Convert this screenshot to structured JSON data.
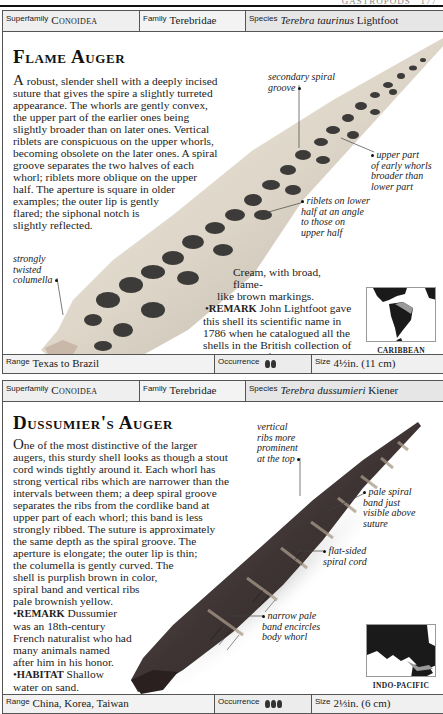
{
  "page": {
    "running_header": "GASTROPODS",
    "page_number": "177"
  },
  "entries": [
    {
      "taxonomy": {
        "superfamily_label": "Superfamily",
        "superfamily": "Conoidea",
        "family_label": "Family",
        "family": "Terebridae",
        "species_label": "Species",
        "species_italic": "Terebra taurinus",
        "species_author": "Lightfoot"
      },
      "title": "Flame Auger",
      "description": "A robust, slender shell with a deeply incised suture that gives the spire a slightly turreted appearance. The whorls are gently convex, the upper part of the earlier ones being slightly broader than on later ones. Vertical riblets are conspicuous on the upper whorls, becoming obsolete on the later ones. A spiral groove separates the two halves of each whorl; riblets more oblique on the upper half. The aperture is square in older examples; the outer lip is gently flared; the siphonal notch is slightly reflected.",
      "description_lines": [
        "robust, slender shell with a deeply incised",
        "suture that gives the spire a slightly turreted",
        "appearance. The whorls are gently convex,",
        "the upper part of the earlier ones being",
        "slightly broader than on later ones. Vertical",
        "riblets are conspicuous on the upper whorls,",
        "becoming obsolete on the later ones. A spiral",
        "groove separates the two halves of each",
        "whorl; riblets more oblique on the upper",
        "half. The aperture is square in older",
        "examples; the outer lip is gently",
        "flared; the siphonal notch is",
        "slightly reflected."
      ],
      "drop_letter": "A",
      "color_note": "Cream, with broad, flame-like brown markings.",
      "color_note_lines": [
        "Cream, with broad, flame-",
        "like brown markings."
      ],
      "remark_label": "Remark",
      "remark": "John Lightfoot gave this shell its scientific name in 1786 when he catalogued all the shells in the British collection of the Duchess of Portland.",
      "remark_lines": [
        "John Lightfoot gave",
        "this shell its scientific name in",
        "1786 when he catalogued all the",
        "shells in the British collection of",
        "the Duchess of Portland."
      ],
      "habitat_label": "Habitat",
      "habitat": "Sand offshore.",
      "callouts": [
        {
          "id": "secondary-spiral-groove",
          "lines": [
            "secondary spiral",
            "groove"
          ]
        },
        {
          "id": "upper-part-early-whorls",
          "lines": [
            "upper part",
            "of early whorls",
            "broader than",
            "lower part"
          ]
        },
        {
          "id": "riblets-lower-half",
          "lines": [
            "riblets on lower",
            "half at an angle",
            "to those on",
            "upper half"
          ]
        },
        {
          "id": "strongly-twisted-columella",
          "lines": [
            "strongly",
            "twisted",
            "columella"
          ]
        }
      ],
      "map_region": "CARIBBEAN",
      "footer": {
        "range_label": "Range",
        "range": "Texas to Brazil",
        "occurrence_label": "Occurrence",
        "occurrence_count": 2,
        "size_label": "Size",
        "size": "4½in. (11 cm)"
      }
    },
    {
      "taxonomy": {
        "superfamily_label": "Superfamily",
        "superfamily": "Conoidea",
        "family_label": "Family",
        "family": "Terebridae",
        "species_label": "Species",
        "species_italic": "Terebra dussumieri",
        "species_author": "Kiener"
      },
      "title": "Dussumier's Auger",
      "drop_letter": "O",
      "description_lines": [
        "ne of the most distinctive of the larger",
        "augers, this sturdy shell looks as though a stout",
        "cord winds tightly around it. Each whorl has",
        "strong vertical ribs which are narrower than the",
        "intervals between them; a deep spiral groove",
        "separates the ribs from the cordlike band at",
        "upper part of each whorl; this band is less",
        "strongly ribbed. The suture is approximately",
        "the same depth as the spiral groove. The",
        "aperture is elongate; the outer lip is thin;",
        "the columella is gently curved. The",
        "shell is purplish brown in color,",
        "spiral band and vertical ribs",
        "pale brownish yellow."
      ],
      "remark_label": "Remark",
      "remark_lines": [
        "Dussumier",
        "was an 18th-century",
        "French naturalist who had",
        "many animals named",
        "after him in his honor."
      ],
      "habitat_label": "Habitat",
      "habitat_lines": [
        "Shallow",
        "water on sand."
      ],
      "callouts": [
        {
          "id": "vertical-ribs-prominent",
          "lines": [
            "vertical",
            "ribs more",
            "prominent",
            "at the top"
          ]
        },
        {
          "id": "pale-spiral-band",
          "lines": [
            "pale spiral",
            "band just",
            "visible above",
            "suture"
          ]
        },
        {
          "id": "flat-sided-spiral-cord",
          "lines": [
            "flat-sided",
            "spiral cord"
          ]
        },
        {
          "id": "narrow-pale-band",
          "lines": [
            "narrow pale",
            "band encircles",
            "body whorl"
          ]
        }
      ],
      "map_region": "INDO-PACIFIC",
      "footer": {
        "range_label": "Range",
        "range": "China, Korea, Taiwan",
        "occurrence_label": "Occurrence",
        "occurrence_count": 3,
        "size_label": "Size",
        "size": "2⅓in. (6 cm)"
      }
    }
  ],
  "colors": {
    "rule": "#111111",
    "bar_bg": "#eeeeee",
    "shell1_base": "#e9e2d6",
    "shell1_marks": "#2a2a2a",
    "shell2_base": "#4a4040",
    "shell2_band": "#8a7d70"
  }
}
